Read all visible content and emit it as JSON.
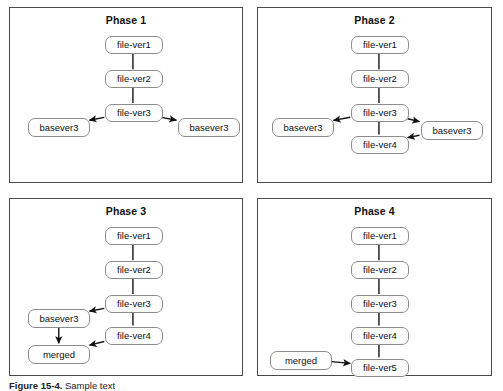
{
  "figure": {
    "caption_label": "Figure 15-4.",
    "caption_text": " Sample text",
    "panel_border_color": "#4a4a4a",
    "node_border_color": "#8c8c8c",
    "edge_color": "#111111"
  },
  "panels": [
    {
      "id": "phase-1",
      "title": "Phase 1",
      "nodes": [
        {
          "id": "p1-file-ver1",
          "label": "file-ver1",
          "x": 95,
          "y": 28,
          "w": 58,
          "h": 18
        },
        {
          "id": "p1-file-ver2",
          "label": "file-ver2",
          "x": 95,
          "y": 62,
          "w": 58,
          "h": 18
        },
        {
          "id": "p1-file-ver3",
          "label": "file-ver3",
          "x": 95,
          "y": 96,
          "w": 58,
          "h": 18
        },
        {
          "id": "p1-basever3-l",
          "label": "basever3",
          "x": 18,
          "y": 110,
          "w": 62,
          "h": 19
        },
        {
          "id": "p1-basever3-r",
          "label": "basever3",
          "x": 168,
          "y": 110,
          "w": 62,
          "h": 19
        }
      ],
      "edges": [
        {
          "from": "p1-file-ver1",
          "to": "p1-file-ver2",
          "arrow": false
        },
        {
          "from": "p1-file-ver2",
          "to": "p1-file-ver3",
          "arrow": false
        },
        {
          "from": "p1-file-ver3",
          "to": "p1-basever3-l",
          "arrow": true
        },
        {
          "from": "p1-file-ver3",
          "to": "p1-basever3-r",
          "arrow": true
        }
      ]
    },
    {
      "id": "phase-2",
      "title": "Phase 2",
      "nodes": [
        {
          "id": "p2-file-ver1",
          "label": "file-ver1",
          "x": 93,
          "y": 28,
          "w": 58,
          "h": 18
        },
        {
          "id": "p2-file-ver2",
          "label": "file-ver2",
          "x": 93,
          "y": 62,
          "w": 58,
          "h": 18
        },
        {
          "id": "p2-file-ver3",
          "label": "file-ver3",
          "x": 93,
          "y": 96,
          "w": 58,
          "h": 18
        },
        {
          "id": "p2-file-ver4",
          "label": "file-ver4",
          "x": 93,
          "y": 128,
          "w": 58,
          "h": 18
        },
        {
          "id": "p2-basever3-l",
          "label": "basever3",
          "x": 14,
          "y": 110,
          "w": 62,
          "h": 19
        },
        {
          "id": "p2-basever3-r",
          "label": "basever3",
          "x": 163,
          "y": 113,
          "w": 62,
          "h": 19
        }
      ],
      "edges": [
        {
          "from": "p2-file-ver1",
          "to": "p2-file-ver2",
          "arrow": false
        },
        {
          "from": "p2-file-ver2",
          "to": "p2-file-ver3",
          "arrow": false
        },
        {
          "from": "p2-file-ver3",
          "to": "p2-file-ver4",
          "arrow": false
        },
        {
          "from": "p2-file-ver3",
          "to": "p2-basever3-l",
          "arrow": true
        },
        {
          "from": "p2-file-ver3",
          "to": "p2-basever3-r",
          "arrow": true
        },
        {
          "from": "p2-basever3-r",
          "to": "p2-file-ver4",
          "arrow": true
        }
      ]
    },
    {
      "id": "phase-3",
      "title": "Phase 3",
      "nodes": [
        {
          "id": "p3-file-ver1",
          "label": "file-ver1",
          "x": 95,
          "y": 28,
          "w": 58,
          "h": 18
        },
        {
          "id": "p3-file-ver2",
          "label": "file-ver2",
          "x": 95,
          "y": 62,
          "w": 58,
          "h": 18
        },
        {
          "id": "p3-file-ver3",
          "label": "file-ver3",
          "x": 95,
          "y": 96,
          "w": 58,
          "h": 18
        },
        {
          "id": "p3-file-ver4",
          "label": "file-ver4",
          "x": 95,
          "y": 128,
          "w": 58,
          "h": 18
        },
        {
          "id": "p3-basever3",
          "label": "basever3",
          "x": 18,
          "y": 110,
          "w": 62,
          "h": 19
        },
        {
          "id": "p3-merged",
          "label": "merged",
          "x": 18,
          "y": 146,
          "w": 62,
          "h": 19
        }
      ],
      "edges": [
        {
          "from": "p3-file-ver1",
          "to": "p3-file-ver2",
          "arrow": false
        },
        {
          "from": "p3-file-ver2",
          "to": "p3-file-ver3",
          "arrow": false
        },
        {
          "from": "p3-file-ver3",
          "to": "p3-file-ver4",
          "arrow": false
        },
        {
          "from": "p3-file-ver3",
          "to": "p3-basever3",
          "arrow": true
        },
        {
          "from": "p3-basever3",
          "to": "p3-merged",
          "arrow": true
        },
        {
          "from": "p3-file-ver4",
          "to": "p3-merged",
          "arrow": true
        }
      ]
    },
    {
      "id": "phase-4",
      "title": "Phase 4",
      "nodes": [
        {
          "id": "p4-file-ver1",
          "label": "file-ver1",
          "x": 93,
          "y": 28,
          "w": 58,
          "h": 18
        },
        {
          "id": "p4-file-ver2",
          "label": "file-ver2",
          "x": 93,
          "y": 62,
          "w": 58,
          "h": 18
        },
        {
          "id": "p4-file-ver3",
          "label": "file-ver3",
          "x": 93,
          "y": 96,
          "w": 58,
          "h": 18
        },
        {
          "id": "p4-file-ver4",
          "label": "file-ver4",
          "x": 93,
          "y": 128,
          "w": 58,
          "h": 18
        },
        {
          "id": "p4-file-ver5",
          "label": "file-ver5",
          "x": 93,
          "y": 160,
          "w": 58,
          "h": 18
        },
        {
          "id": "p4-merged",
          "label": "merged",
          "x": 12,
          "y": 152,
          "w": 62,
          "h": 19
        }
      ],
      "edges": [
        {
          "from": "p4-file-ver1",
          "to": "p4-file-ver2",
          "arrow": false
        },
        {
          "from": "p4-file-ver2",
          "to": "p4-file-ver3",
          "arrow": false
        },
        {
          "from": "p4-file-ver3",
          "to": "p4-file-ver4",
          "arrow": false
        },
        {
          "from": "p4-file-ver4",
          "to": "p4-file-ver5",
          "arrow": false
        },
        {
          "from": "p4-merged",
          "to": "p4-file-ver5",
          "arrow": true
        }
      ]
    }
  ],
  "panel_boxes": [
    {
      "x": 9,
      "y": 7,
      "w": 234,
      "h": 176
    },
    {
      "x": 257,
      "y": 7,
      "w": 235,
      "h": 176
    },
    {
      "x": 9,
      "y": 198,
      "w": 234,
      "h": 178
    },
    {
      "x": 257,
      "y": 198,
      "w": 235,
      "h": 178
    }
  ]
}
